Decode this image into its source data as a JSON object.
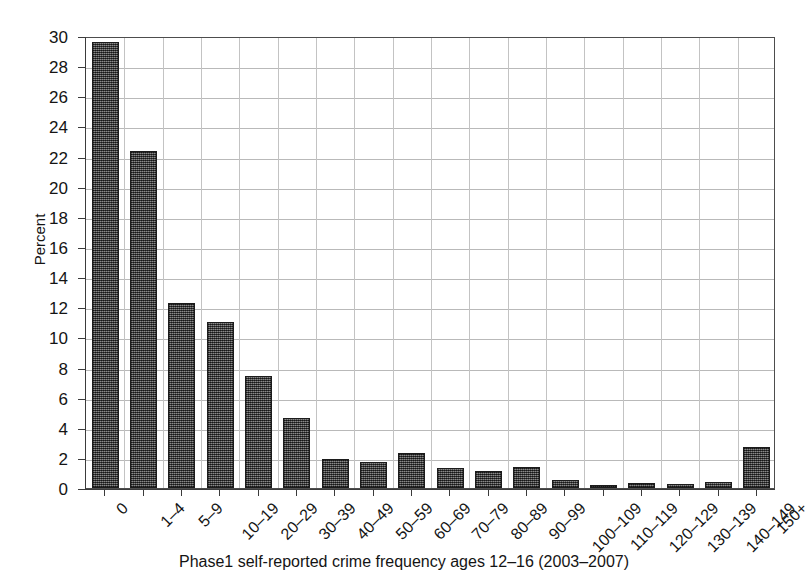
{
  "chart_data": {
    "type": "bar",
    "title": "",
    "xlabel": "Phase1 self-reported crime frequency ages 12–16 (2003–2007)",
    "ylabel": "Percent",
    "ylim": [
      0,
      30
    ],
    "ytick_step": 2,
    "grid": "both",
    "legend": "none",
    "bar_color": "#5b5b5b",
    "bar_edge_color": "#1c1c1c",
    "categories": [
      "0",
      "1–4",
      "5–9",
      "10–19",
      "20–29",
      "30–39",
      "40–49",
      "50–59",
      "60–69",
      "70–79",
      "80–89",
      "90–99",
      "100–109",
      "110–119",
      "120–129",
      "130–139",
      "140–149",
      "150+"
    ],
    "values": [
      29.6,
      22.4,
      12.3,
      11.0,
      7.45,
      4.65,
      1.9,
      1.75,
      2.3,
      1.3,
      1.15,
      1.4,
      0.55,
      0.2,
      0.35,
      0.25,
      0.4,
      2.7
    ],
    "ytick_labels": [
      "0",
      "2",
      "4",
      "6",
      "8",
      "10",
      "12",
      "14",
      "16",
      "18",
      "20",
      "22",
      "24",
      "26",
      "28",
      "30"
    ]
  }
}
